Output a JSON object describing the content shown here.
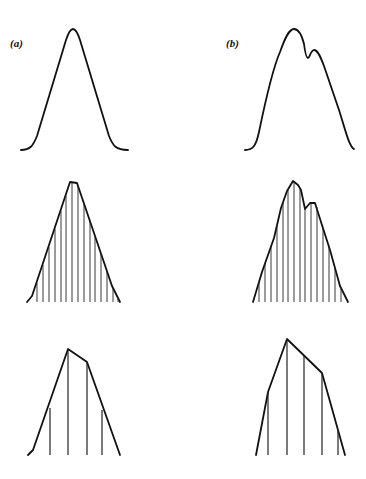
{
  "figure": {
    "panels": [
      {
        "id": "a",
        "label": "(a)",
        "description": "Smooth unimodal distribution curve"
      },
      {
        "id": "b",
        "label": "(b)",
        "description": "Smooth bimodal distribution curve with shoulder peak"
      }
    ],
    "rows": [
      {
        "name": "continuous-curve",
        "description": "Smooth curve"
      },
      {
        "name": "fine-sampling",
        "description": "Curve approximated with many narrow vertical strips"
      },
      {
        "name": "coarse-sampling",
        "description": "Curve approximated with few wide strips (polygonal)"
      }
    ]
  }
}
